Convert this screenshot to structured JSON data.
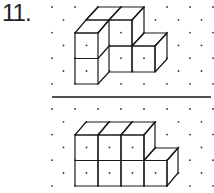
{
  "problem": {
    "number_label": "11.",
    "top_figure": {
      "description": "isometric cube structure on dot grid (given view)",
      "cube_count": 5
    },
    "bottom_figure": {
      "description": "isometric cube structure on dot grid",
      "cube_count": 7
    }
  },
  "colors": {
    "ink": "#1a1a1a",
    "dot": "#333333",
    "background": "#ffffff"
  }
}
